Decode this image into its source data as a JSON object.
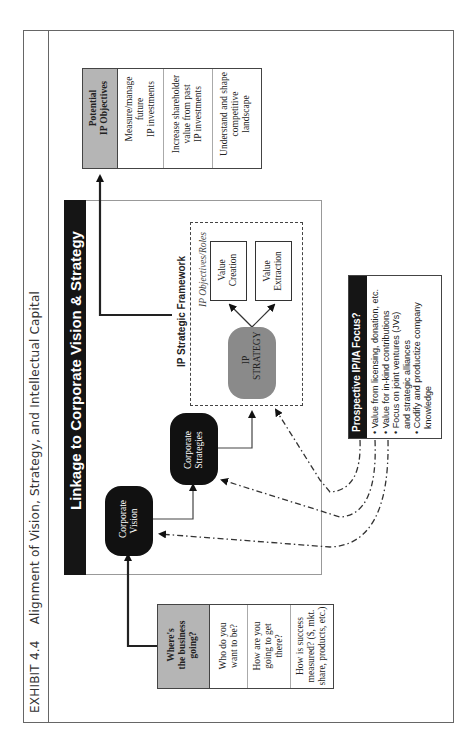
{
  "page": {
    "exhibit_label": "EXHIBIT 4.4",
    "title": "Alignment of Vision, Strategy, and Intellectual Capital"
  },
  "diagram": {
    "banner": "Linkage to Corporate Vision & Strategy",
    "corporate_vision": [
      "Corporate",
      "Vision"
    ],
    "corporate_strategies": [
      "Corporate",
      "Strategies"
    ],
    "framework": {
      "title": "IP Strategic Framework",
      "subtitle": "IP Objectives/Roles",
      "ip_strategy": [
        "IP",
        "STRATEGY"
      ],
      "value_creation": [
        "Value",
        "Creation"
      ],
      "value_extraction": [
        "Value",
        "Extraction"
      ]
    },
    "business_table": {
      "header": [
        "Where's",
        "the business",
        "going?"
      ],
      "rows": [
        [
          "Who do you",
          "want to be?"
        ],
        [
          "How are you",
          "going to get",
          "there?"
        ],
        [
          "How is success",
          "measured? ($, mkt.",
          "share, products, etc.)"
        ]
      ]
    },
    "objectives_table": {
      "header": [
        "Potential",
        "IP Objectives"
      ],
      "rows": [
        [
          "Measure/manage",
          "future",
          "IP investments"
        ],
        [
          "Increase shareholder",
          "value from past",
          "IP investments"
        ],
        [
          "Understand and shape",
          "competitive",
          "landscape"
        ]
      ]
    },
    "focus_box": {
      "header": "Prospective IP/IA Focus?",
      "items": [
        "Value from licensing, donation, etc.",
        "Value for in-kind contributions",
        "Focus on joint ventures (JVs)",
        "and strategic alliances",
        "Codify and productize company",
        "knowledge"
      ],
      "bullets": [
        true,
        true,
        true,
        false,
        true,
        false
      ]
    },
    "colors": {
      "banner_bg": "#151515",
      "pill_black": "#111111",
      "pill_grey": "#8a8a8a",
      "table_header": "#b5b5b5"
    }
  }
}
